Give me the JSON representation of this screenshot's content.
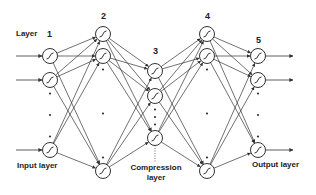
{
  "diagram": {
    "type": "autoencoder-neural-network",
    "layers": [
      {
        "number": "1",
        "name": "Input layer",
        "x": 50,
        "nodes": [
          56,
          80,
          150
        ]
      },
      {
        "number": "2",
        "name": "",
        "x": 103,
        "nodes": [
          34,
          56,
          171
        ]
      },
      {
        "number": "3",
        "name": "Compression layer",
        "x": 155,
        "nodes": [
          71,
          96,
          138
        ]
      },
      {
        "number": "4",
        "name": "",
        "x": 207,
        "nodes": [
          34,
          56,
          171
        ]
      },
      {
        "number": "5",
        "name": "Output layer",
        "x": 258,
        "nodes": [
          56,
          80,
          150
        ]
      }
    ],
    "labels": {
      "layer": "Layer",
      "l1": "1",
      "l2": "2",
      "l3": "3",
      "l4": "4",
      "l5": "5",
      "input": "Input layer",
      "compression_line1": "Compression",
      "compression_line2": "layer",
      "output": "Output layer"
    },
    "colors": {
      "stroke": "#333333",
      "text": "#222222",
      "background": "#ffffff"
    }
  }
}
